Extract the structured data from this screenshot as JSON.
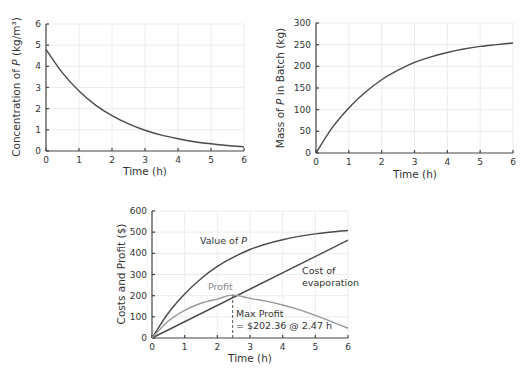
{
  "chart_data": [
    {
      "id": "concentration",
      "type": "line",
      "title": "",
      "xlabel": "Time (h)",
      "ylabel_parts": [
        "Concentration of ",
        "P",
        " (kg/m³)"
      ],
      "xlim": [
        0,
        6
      ],
      "ylim": [
        0,
        6
      ],
      "xticks": [
        0,
        1,
        2,
        3,
        4,
        5,
        6
      ],
      "yticks": [
        0,
        1,
        2,
        3,
        4,
        5,
        6
      ],
      "grid": true,
      "series": [
        {
          "name": "Concentration of P",
          "x": [
            0,
            0.5,
            1,
            1.5,
            2,
            2.5,
            3,
            3.5,
            4,
            4.5,
            5,
            5.5,
            6
          ],
          "values": [
            4.8,
            3.69,
            2.83,
            2.17,
            1.67,
            1.28,
            0.98,
            0.75,
            0.58,
            0.44,
            0.34,
            0.26,
            0.2
          ]
        }
      ]
    },
    {
      "id": "mass",
      "type": "line",
      "title": "",
      "xlabel": "Time (h)",
      "ylabel_parts": [
        "Mass of ",
        "P",
        " in Batch (kg)"
      ],
      "xlim": [
        0,
        6
      ],
      "ylim": [
        0,
        300
      ],
      "xticks": [
        0,
        1,
        2,
        3,
        4,
        5,
        6
      ],
      "yticks": [
        0,
        50,
        100,
        150,
        200,
        250,
        300
      ],
      "grid": true,
      "series": [
        {
          "name": "Mass of P in Batch",
          "x": [
            0,
            0.5,
            1,
            1.5,
            2,
            2.5,
            3,
            3.5,
            4,
            4.5,
            5,
            5.5,
            6
          ],
          "values": [
            0,
            59,
            104,
            140,
            169,
            191,
            209,
            222,
            232,
            240,
            246,
            250,
            254
          ]
        }
      ]
    },
    {
      "id": "costs-profit",
      "type": "line",
      "title": "",
      "xlabel": "Time (h)",
      "ylabel": "Costs and Profit ($)",
      "xlim": [
        0,
        6
      ],
      "ylim": [
        0,
        600
      ],
      "xticks": [
        0,
        1,
        2,
        3,
        4,
        5,
        6
      ],
      "yticks": [
        0,
        100,
        200,
        300,
        400,
        500,
        600
      ],
      "grid": true,
      "series": [
        {
          "name": "Value of P",
          "x": [
            0,
            0.5,
            1,
            1.5,
            2,
            2.5,
            3,
            3.5,
            4,
            4.5,
            5,
            5.5,
            6
          ],
          "values": [
            0,
            118,
            208,
            280,
            338,
            382,
            418,
            444,
            464,
            480,
            492,
            501,
            508
          ]
        },
        {
          "name": "Cost of evaporation",
          "x": [
            0,
            6
          ],
          "values": [
            0,
            462
          ]
        },
        {
          "name": "Profit",
          "x": [
            0,
            0.5,
            1,
            1.5,
            2,
            2.47,
            3,
            3.5,
            4,
            4.5,
            5,
            5.5,
            6
          ],
          "values": [
            0,
            80,
            131,
            164,
            184,
            202.36,
            187,
            174,
            156,
            134,
            107,
            77,
            46
          ]
        }
      ],
      "annotations": [
        {
          "text_parts": [
            "Value of ",
            "P"
          ],
          "x": 1.9,
          "y": 455
        },
        {
          "text": "Cost of",
          "x": 4.65,
          "y": 305
        },
        {
          "text": "evaporation",
          "x": 4.65,
          "y": 245
        },
        {
          "text": "Profit",
          "x": 1.75,
          "y": 228
        },
        {
          "text": "Max Profit",
          "x": 2.62,
          "y": 130
        },
        {
          "text": "= $202.36 @ 2.47 h",
          "x": 2.62,
          "y": 70
        }
      ],
      "vline": {
        "x": 2.47,
        "y_top": 202.36,
        "style": "dashed"
      }
    }
  ],
  "labels": {
    "c1_x": "Time (h)",
    "c1_y_pre": "Concentration of ",
    "c1_y_it": "P",
    "c1_y_post": " (kg/m³)",
    "c2_x": "Time (h)",
    "c2_y_pre": "Mass of ",
    "c2_y_it": "P",
    "c2_y_post": " in Batch (kg)",
    "c3_x": "Time (h)",
    "c3_y": "Costs and Profit ($)",
    "c3_value_pre": "Value of ",
    "c3_value_it": "P",
    "c3_cost1": "Cost of",
    "c3_cost2": "evaporation",
    "c3_profit": "Profit",
    "c3_max1": "Max Profit",
    "c3_max2": "= $202.36 @ 2.47 h"
  }
}
